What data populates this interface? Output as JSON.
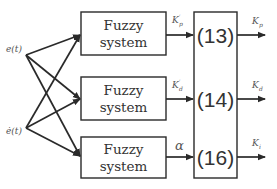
{
  "diagram": {
    "inputs": [
      {
        "id": "e",
        "label": "e(t)"
      },
      {
        "id": "edot",
        "label": "ė(t)"
      }
    ],
    "fuzzy_blocks": [
      {
        "line1": "Fuzzy",
        "line2": "system"
      },
      {
        "line1": "Fuzzy",
        "line2": "system"
      },
      {
        "line1": "Fuzzy",
        "line2": "system"
      }
    ],
    "intermediate_signals": [
      {
        "base": "K",
        "sup": "′",
        "sub": "p"
      },
      {
        "base": "K",
        "sup": "′",
        "sub": "d"
      },
      {
        "base": "α",
        "sup": "",
        "sub": ""
      }
    ],
    "equation_block": {
      "rows": [
        "(13)",
        "(14)",
        "(16)"
      ]
    },
    "outputs": [
      {
        "base": "K",
        "sub": "p"
      },
      {
        "base": "K",
        "sub": "d"
      },
      {
        "base": "K",
        "sub": "i"
      }
    ],
    "colors": {
      "stroke": "#2a2a2a",
      "text": "#333333",
      "label": "#555555",
      "background": "#ffffff"
    }
  }
}
